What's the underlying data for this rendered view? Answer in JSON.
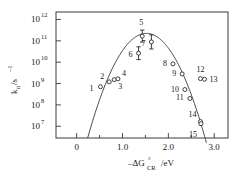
{
  "chart_data": {
    "type": "scatter",
    "title": "",
    "xlabel": "-ΔG°CR /eV",
    "ylabel": "k n /s-1",
    "xlabel_parts": {
      "minus": "–",
      "delta": "Δ",
      "g": "G",
      "degree": "°",
      "subscript": "CR",
      "unit": "/eV"
    },
    "ylabel_parts": {
      "k": "k",
      "subscript": "n",
      "slash": "/s",
      "exponent": "–1"
    },
    "xlim": [
      -0.45,
      3.3
    ],
    "ylim_log": [
      6.45,
      12.35
    ],
    "grid": false,
    "legend": null,
    "x_ticks": [
      0,
      1.0,
      2.0,
      3.0
    ],
    "x_tick_labels": [
      "0",
      "1.0",
      "2.0",
      "3.0"
    ],
    "x_minor_ticks": [
      -0.5,
      0.5,
      1.5,
      2.5
    ],
    "y_ticks_log": [
      7,
      8,
      9,
      10,
      11,
      12
    ],
    "y_tick_labels": [
      "10",
      "10",
      "10",
      "10",
      "10",
      "10"
    ],
    "y_tick_exponents": [
      "7",
      "8",
      "9",
      "10",
      "11",
      "12"
    ],
    "points": [
      {
        "label": "1",
        "x": 0.52,
        "y_log": 8.85,
        "label_dx": -11,
        "label_dy": 4,
        "err": null
      },
      {
        "label": "2",
        "x": 0.71,
        "y_log": 9.08,
        "label_dx": -9,
        "label_dy": -3,
        "err": null
      },
      {
        "label": "3",
        "x": 0.82,
        "y_log": 9.18,
        "label_dx": 4,
        "label_dy": 9,
        "err": null
      },
      {
        "label": "4",
        "x": 0.9,
        "y_log": 9.22,
        "label_dx": 4,
        "label_dy": -3,
        "err": null
      },
      {
        "label": "5",
        "x": 1.43,
        "y_log": 11.22,
        "label_dx": -3,
        "label_dy": -11,
        "err": 0.28
      },
      {
        "label": "6",
        "x": 1.35,
        "y_log": 10.42,
        "label_dx": -10,
        "label_dy": 4,
        "err": 0.3
      },
      {
        "label": "7",
        "x": 1.63,
        "y_log": 10.95,
        "label_dx": -10,
        "label_dy": 4,
        "err": 0.33
      },
      {
        "label": "8",
        "x": 2.1,
        "y_log": 9.92,
        "label_dx": -10,
        "label_dy": 2,
        "err": null
      },
      {
        "label": "9",
        "x": 2.3,
        "y_log": 9.45,
        "label_dx": -10,
        "label_dy": 2,
        "err": null
      },
      {
        "label": "10",
        "x": 2.36,
        "y_log": 8.72,
        "label_dx": -14,
        "label_dy": 2,
        "err": null
      },
      {
        "label": "11",
        "x": 2.47,
        "y_log": 8.3,
        "label_dx": -14,
        "label_dy": 2,
        "err": null
      },
      {
        "label": "12",
        "x": 2.7,
        "y_log": 9.23,
        "label_dx": -4,
        "label_dy": -7,
        "err": null
      },
      {
        "label": "13",
        "x": 2.79,
        "y_log": 9.2,
        "label_dx": 5,
        "label_dy": 3,
        "err": null
      },
      {
        "label": "14",
        "x": 2.7,
        "y_log": 7.22,
        "label_dx": -12,
        "label_dy": -5,
        "err": null
      },
      {
        "label": "15",
        "x": 2.71,
        "y_log": 7.12,
        "label_dx": -12,
        "label_dy": 13,
        "err": null
      }
    ],
    "curve": {
      "description": "Marcus parabola in log space",
      "peak_x": 1.52,
      "peak_y_log": 11.35,
      "width": 1.28,
      "x_start": 0.24,
      "x_end": 3.22
    }
  },
  "colors": {
    "axis": "#3a3a3a",
    "curve": "#4a4a4a",
    "marker_edge": "#2a2a2a",
    "marker_fill": "#ffffff",
    "text": "#1a1a1a",
    "background": "#ffffff"
  }
}
